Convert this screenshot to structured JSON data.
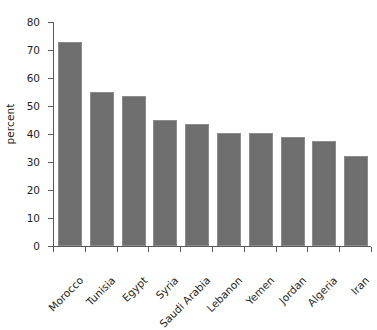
{
  "chart_data": {
    "type": "bar",
    "title": "",
    "subtitle": "",
    "xlabel": "",
    "ylabel": "percent",
    "categories": [
      "Morocco",
      "Tunisia",
      "Egypt",
      "Syria",
      "Saudi Arabia",
      "Lebanon",
      "Yemen",
      "Jordan",
      "Algeria",
      "Iran"
    ],
    "values": [
      73,
      55,
      53.5,
      45,
      43.5,
      40.5,
      40.5,
      39,
      37.5,
      32
    ],
    "ylim": [
      0,
      80
    ],
    "yticks": [
      0,
      10,
      20,
      30,
      40,
      50,
      60,
      70,
      80
    ],
    "ytick_labels": [
      "0",
      "10",
      "20",
      "30",
      "40",
      "50",
      "60",
      "70",
      "80"
    ],
    "grid": false,
    "legend": null,
    "legend_position": "none",
    "bar_color": "#6e6e6e",
    "bar_edge_color": "#8c8c8c",
    "axis_color": "#58595b",
    "background_color": "#ffffff",
    "text_color": "#231f20",
    "xtick_label_rotation": -45
  }
}
